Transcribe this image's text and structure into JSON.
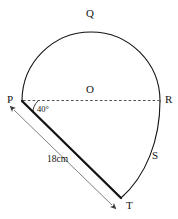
{
  "figure": {
    "background_color": "#ffffff",
    "stroke_color": "#141414",
    "dimension_color": "#4a4a4a",
    "points": {
      "P": {
        "label": "P",
        "x": 22,
        "y": 101
      },
      "Q": {
        "label": "Q",
        "x": 91,
        "y": 32
      },
      "O": {
        "label": "O",
        "x": 91,
        "y": 101
      },
      "R": {
        "label": "R",
        "x": 160,
        "y": 101
      },
      "S": {
        "label": "S",
        "x": 152,
        "y": 158
      },
      "T": {
        "label": "T",
        "x": 121,
        "y": 198
      }
    },
    "labels": {
      "P": "P",
      "Q": "Q",
      "O": "O",
      "R": "R",
      "S": "S",
      "T": "T"
    },
    "angle": {
      "name": "angle-at-P",
      "value": "40°",
      "vertex": "P",
      "between": [
        "P-R dashed diameter",
        "P-T chord"
      ]
    },
    "dimension": {
      "name": "segment-PT-length",
      "value": "18 cm",
      "display": "18cm",
      "from": "P",
      "to": "T",
      "arrow_style": "double-headed"
    },
    "segments": [
      {
        "name": "semicircle-P-Q-R",
        "type": "arc",
        "style": "solid",
        "weight": "thin"
      },
      {
        "name": "arc-R-S-T",
        "type": "arc",
        "style": "solid",
        "weight": "thin"
      },
      {
        "name": "chord-P-T",
        "type": "line",
        "style": "solid",
        "weight": "thick"
      },
      {
        "name": "diameter-P-O-R",
        "type": "line",
        "style": "dashed",
        "weight": "hairline"
      }
    ]
  }
}
